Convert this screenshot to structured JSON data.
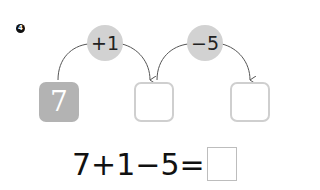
{
  "problem": {
    "number": "4",
    "start_value": "7",
    "operations": [
      {
        "label": "+1"
      },
      {
        "label": "−5"
      }
    ],
    "answer_boxes": [
      "",
      ""
    ]
  },
  "equation": {
    "text": "7+1−5=",
    "answer": ""
  },
  "colors": {
    "op_circle": "#d2d2d2",
    "start_box": "#b3b3b3",
    "empty_box_border": "#cfcfcf",
    "arrow": "#555555"
  }
}
